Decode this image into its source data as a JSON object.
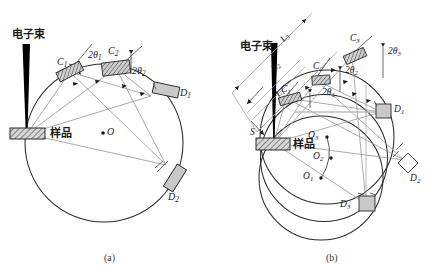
{
  "figure": {
    "title_a_caption": "(a)",
    "title_b_caption": "(b)",
    "background_color": "#ffffff",
    "line_color": "#1a1a1a",
    "ray_color": "#8a8a8a",
    "detector_fill": "#c9c9c9",
    "beam_color": "#000000"
  },
  "panel_a": {
    "caption": "(a)",
    "beam_label": "电子束",
    "sample_label": "样品",
    "center_label": "O",
    "crystals": [
      {
        "id": "C1",
        "label": "C",
        "sub": "1"
      },
      {
        "id": "C2",
        "label": "C",
        "sub": "2"
      }
    ],
    "angles": [
      {
        "id": "2theta1",
        "label": "2θ",
        "sub": "1"
      },
      {
        "id": "2theta2",
        "label": "2θ",
        "sub": "2"
      }
    ],
    "detectors": [
      {
        "id": "D1",
        "label": "D",
        "sub": "1"
      },
      {
        "id": "D2",
        "label": "D",
        "sub": "2"
      }
    ]
  },
  "panel_b": {
    "caption": "(b)",
    "beam_label": "电子束",
    "sample_label": "样品",
    "source_label": "S",
    "distances": [
      {
        "id": "L1",
        "label": "L",
        "sub": "1"
      },
      {
        "id": "L2",
        "label": "L",
        "sub": "2"
      },
      {
        "id": "L3",
        "label": "L",
        "sub": "3"
      }
    ],
    "crystals": [
      {
        "id": "C1",
        "label": "C",
        "sub": "1"
      },
      {
        "id": "C2",
        "label": "C",
        "sub": "2"
      },
      {
        "id": "C3",
        "label": "C",
        "sub": "3"
      }
    ],
    "angles": [
      {
        "id": "2theta1",
        "label": "2θ",
        "sub": "1"
      },
      {
        "id": "2theta2",
        "label": "2θ",
        "sub": "2"
      },
      {
        "id": "2theta3",
        "label": "2θ",
        "sub": "3"
      }
    ],
    "centers": [
      {
        "id": "O1",
        "label": "O",
        "sub": "1"
      },
      {
        "id": "O2",
        "label": "O",
        "sub": "2"
      },
      {
        "id": "O3",
        "label": "O",
        "sub": "3"
      }
    ],
    "detectors": [
      {
        "id": "D1",
        "label": "D",
        "sub": "1"
      },
      {
        "id": "D2",
        "label": "D",
        "sub": "2"
      },
      {
        "id": "D3",
        "label": "D",
        "sub": "3"
      }
    ]
  }
}
